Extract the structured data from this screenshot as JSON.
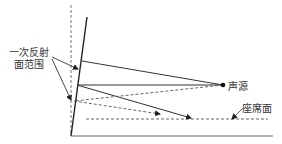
{
  "labels": {
    "reflection_range_line1": "一次反射",
    "reflection_range_line2": "面范围",
    "sound_source": "声源",
    "seating_plane": "座席面"
  },
  "colors": {
    "line": "#333333",
    "dashed": "#555555",
    "floor": "#666666"
  }
}
